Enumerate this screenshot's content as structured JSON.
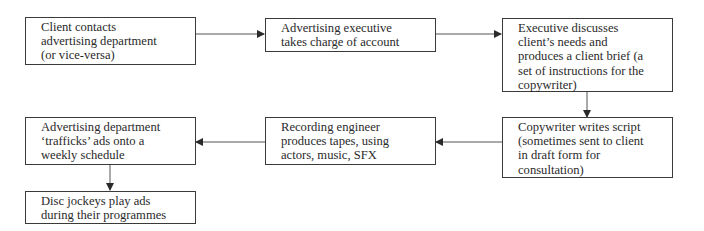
{
  "diagram": {
    "type": "flowchart",
    "nodes": [
      {
        "id": "n1",
        "label": "Client contacts advertising department (or vice-versa)",
        "lines": [
          "Client contacts",
          "advertising department",
          "(or vice-versa)"
        ]
      },
      {
        "id": "n2",
        "label": "Advertising executive takes charge of account",
        "lines": [
          "Advertising executive",
          "takes charge of account"
        ]
      },
      {
        "id": "n3",
        "label": "Executive discusses client's needs and produces a client brief (a set of instructions for the copywriter)",
        "lines": [
          "Executive discusses",
          "client’s needs and",
          "produces a client brief (a",
          "set of instructions for the",
          "copywriter)"
        ]
      },
      {
        "id": "n4",
        "label": "Copywriter writes script (sometimes sent to client in draft form for consultation)",
        "lines": [
          "Copywriter writes script",
          "(sometimes sent to client",
          "in draft form for",
          "consultation)"
        ]
      },
      {
        "id": "n5",
        "label": "Recording engineer produces tapes, using actors, music, SFX",
        "lines": [
          "Recording engineer",
          "produces tapes, using",
          "actors, music, SFX"
        ]
      },
      {
        "id": "n6",
        "label": "Advertising department 'trafficks' ads onto a weekly schedule",
        "lines": [
          "Advertising department",
          "‘trafficks’ ads onto a",
          "weekly schedule"
        ]
      },
      {
        "id": "n7",
        "label": "Disc jockeys play ads during their programmes",
        "lines": [
          "Disc jockeys play ads",
          "during their programmes"
        ]
      }
    ],
    "edges": [
      {
        "from": "n1",
        "to": "n2"
      },
      {
        "from": "n2",
        "to": "n3"
      },
      {
        "from": "n3",
        "to": "n4"
      },
      {
        "from": "n4",
        "to": "n5"
      },
      {
        "from": "n5",
        "to": "n6"
      },
      {
        "from": "n6",
        "to": "n7"
      }
    ]
  },
  "colors": {
    "line": "#3a3a3a",
    "text": "#2a2a2a",
    "background": "#ffffff"
  }
}
